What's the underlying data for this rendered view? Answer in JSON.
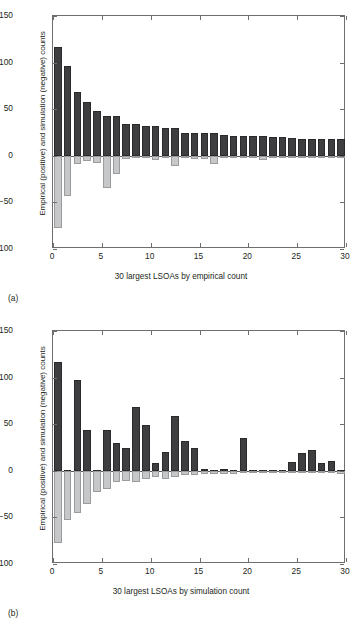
{
  "figure": {
    "axis": {
      "ylabel": "Empirical (positive) and simulation (negative) counts",
      "yticks": [
        150,
        100,
        50,
        0,
        -50,
        -100
      ],
      "ytick_labels": [
        "150",
        "100",
        "50",
        "0",
        "−50",
        "−100"
      ],
      "xticks": [
        0,
        5,
        10,
        15,
        20,
        25,
        30
      ],
      "xtick_labels": [
        "0",
        "5",
        "10",
        "15",
        "20",
        "25",
        "30"
      ],
      "ylim": [
        -100,
        150
      ],
      "xlim": [
        0,
        30
      ]
    },
    "colors": {
      "positive_bar": "#3e3e40",
      "negative_bar": "#c6c7c8",
      "axis": "#6d6e71",
      "text": "#231f20"
    },
    "panel_a": {
      "tag": "(a)",
      "xlabel": "30 largest LSOAs by empirical count"
    },
    "panel_b": {
      "tag": "(b)",
      "xlabel": "30 largest LSOAs by simulation count"
    }
  },
  "chart_data": [
    {
      "type": "bar",
      "panel": "(a)",
      "title": "",
      "xlabel": "30 largest LSOAs by empirical count",
      "ylabel": "Empirical (positive) and simulation (negative) counts",
      "xlim": [
        0,
        30
      ],
      "ylim": [
        -100,
        150
      ],
      "grid": false,
      "legend": null,
      "x": [
        0.5,
        1.5,
        2.5,
        3.5,
        4.5,
        5.5,
        6.5,
        7.5,
        8.5,
        9.5,
        10.5,
        11.5,
        12.5,
        13.5,
        14.5,
        15.5,
        16.5,
        17.5,
        18.5,
        19.5,
        20.5,
        21.5,
        22.5,
        23.5,
        24.5,
        25.5,
        26.5,
        27.5,
        28.5,
        29.5
      ],
      "series": [
        {
          "name": "Empirical (positive) counts",
          "color": "#3e3e40",
          "values": [
            117,
            96,
            68,
            58,
            48,
            43,
            43,
            34,
            34,
            32,
            32,
            30,
            30,
            25,
            25,
            24,
            24,
            22,
            21,
            21,
            21,
            21,
            20,
            20,
            19,
            18,
            18,
            18,
            18,
            18
          ]
        },
        {
          "name": "Simulation (negative) counts",
          "color": "#c6c7c8",
          "values": [
            -78,
            -43,
            -9,
            -6,
            -8,
            -35,
            -19,
            -3,
            -1,
            -1,
            -5,
            -1,
            -11,
            -1,
            -3,
            -3,
            -9,
            -1,
            -1,
            -1,
            -1,
            -5,
            -2,
            -2,
            -1,
            -1,
            -1,
            -1,
            -1,
            -2
          ]
        }
      ]
    },
    {
      "type": "bar",
      "panel": "(b)",
      "title": "",
      "xlabel": "30 largest LSOAs by simulation count",
      "ylabel": "Empirical (positive) and simulation (negative) counts",
      "xlim": [
        0,
        30
      ],
      "ylim": [
        -100,
        150
      ],
      "grid": false,
      "legend": null,
      "x": [
        0.5,
        1.5,
        2.5,
        3.5,
        4.5,
        5.5,
        6.5,
        7.5,
        8.5,
        9.5,
        10.5,
        11.5,
        12.5,
        13.5,
        14.5,
        15.5,
        16.5,
        17.5,
        18.5,
        19.5,
        20.5,
        21.5,
        22.5,
        23.5,
        24.5,
        25.5,
        26.5,
        27.5,
        28.5,
        29.5
      ],
      "series": [
        {
          "name": "Empirical (positive) counts",
          "color": "#3e3e40",
          "values": [
            117,
            1,
            97,
            44,
            1,
            44,
            30,
            24,
            68,
            49,
            8,
            20,
            59,
            32,
            25,
            2,
            1,
            2,
            1,
            35,
            1,
            1,
            1,
            1,
            9,
            19,
            22,
            8,
            11,
            1
          ]
        },
        {
          "name": "Simulation (negative) counts",
          "color": "#c6c7c8",
          "values": [
            -78,
            -53,
            -45,
            -36,
            -23,
            -19,
            -12,
            -11,
            -12,
            -9,
            -7,
            -9,
            -7,
            -5,
            -4,
            -3,
            -3,
            -3,
            -3,
            -2,
            -2,
            -2,
            -2,
            -2,
            -2,
            -2,
            -2,
            -2,
            -2,
            -3
          ]
        }
      ]
    }
  ]
}
